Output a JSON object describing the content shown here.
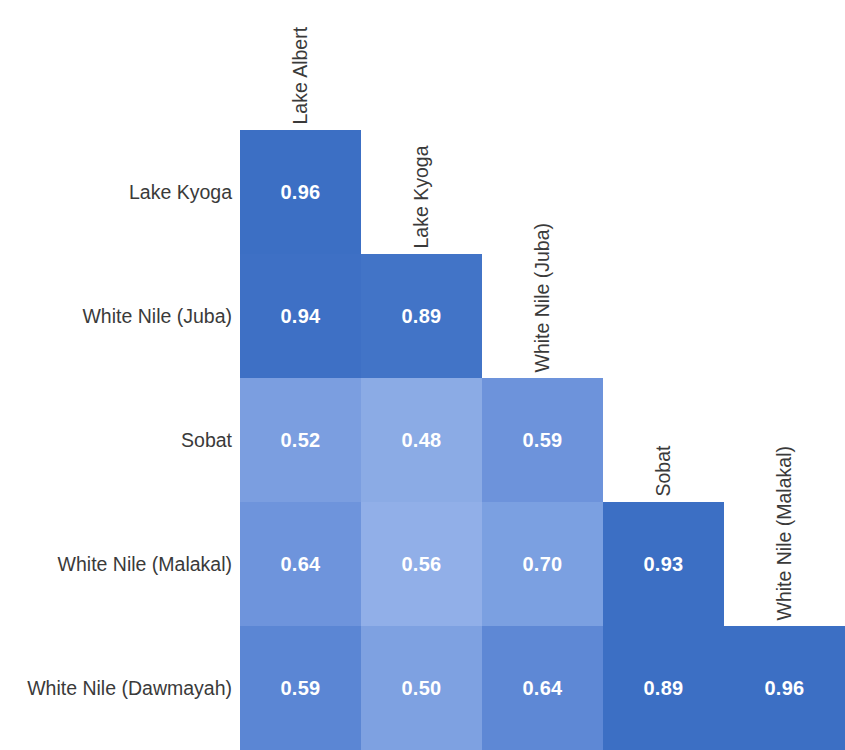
{
  "chart_data": {
    "type": "heatmap",
    "title": "",
    "subtitle": "",
    "xlabel": "",
    "ylabel": "",
    "layout": "lower-triangular correlation matrix",
    "grid": false,
    "legend": "none",
    "value_format": "2 decimals",
    "colorscale": {
      "name": "blue-sequential",
      "low_hex": "#9CB6EA",
      "mid_hex": "#7B9EE0",
      "high_hex": "#3C6FC4",
      "domain": [
        0.45,
        1.0
      ]
    },
    "text_color_hex": "#FFFFFF",
    "label_color_hex": "#3A3A3A",
    "background_hex": "#FFFFFF",
    "columns": [
      "Lake Albert",
      "Lake Kyoga",
      "White Nile (Juba)",
      "Sobat",
      "White Nile (Malakal)"
    ],
    "rows": [
      "Lake Kyoga",
      "White Nile (Juba)",
      "Sobat",
      "White Nile (Malakal)",
      "White Nile (Dawmayah)"
    ],
    "cells": [
      {
        "row": "Lake Kyoga",
        "col": "Lake Albert",
        "value": "0.96",
        "v": 0.96,
        "color": "#3C6FC4",
        "r": 0,
        "c": 0
      },
      {
        "row": "White Nile (Juba)",
        "col": "Lake Albert",
        "value": "0.94",
        "v": 0.94,
        "color": "#3E70C5",
        "r": 1,
        "c": 0
      },
      {
        "row": "White Nile (Juba)",
        "col": "Lake Kyoga",
        "value": "0.89",
        "v": 0.89,
        "color": "#4274C7",
        "r": 1,
        "c": 1
      },
      {
        "row": "Sobat",
        "col": "Lake Albert",
        "value": "0.52",
        "v": 0.52,
        "color": "#7B9EE0",
        "r": 2,
        "c": 0
      },
      {
        "row": "Sobat",
        "col": "Lake Kyoga",
        "value": "0.48",
        "v": 0.48,
        "color": "#8BABE5",
        "r": 2,
        "c": 1
      },
      {
        "row": "Sobat",
        "col": "White Nile (Juba)",
        "value": "0.59",
        "v": 0.59,
        "color": "#6D93DB",
        "r": 2,
        "c": 2
      },
      {
        "row": "White Nile (Malakal)",
        "col": "Lake Albert",
        "value": "0.64",
        "v": 0.64,
        "color": "#6E94DC",
        "r": 3,
        "c": 0
      },
      {
        "row": "White Nile (Malakal)",
        "col": "Lake Kyoga",
        "value": "0.56",
        "v": 0.56,
        "color": "#91AFE8",
        "r": 3,
        "c": 1
      },
      {
        "row": "White Nile (Malakal)",
        "col": "White Nile (Juba)",
        "value": "0.70",
        "v": 0.7,
        "color": "#7BA0E1",
        "r": 3,
        "c": 2
      },
      {
        "row": "White Nile (Malakal)",
        "col": "Sobat",
        "value": "0.93",
        "v": 0.93,
        "color": "#3C6FC4",
        "r": 3,
        "c": 3
      },
      {
        "row": "White Nile (Dawmayah)",
        "col": "Lake Albert",
        "value": "0.59",
        "v": 0.59,
        "color": "#5B86D4",
        "r": 4,
        "c": 0
      },
      {
        "row": "White Nile (Dawmayah)",
        "col": "Lake Kyoga",
        "value": "0.50",
        "v": 0.5,
        "color": "#7EA1E1",
        "r": 4,
        "c": 1
      },
      {
        "row": "White Nile (Dawmayah)",
        "col": "White Nile (Juba)",
        "value": "0.64",
        "v": 0.64,
        "color": "#5E88D5",
        "r": 4,
        "c": 2
      },
      {
        "row": "White Nile (Dawmayah)",
        "col": "Sobat",
        "value": "0.89",
        "v": 0.89,
        "color": "#3C6FC4",
        "r": 4,
        "c": 3
      },
      {
        "row": "White Nile (Dawmayah)",
        "col": "White Nile (Malakal)",
        "value": "0.96",
        "v": 0.96,
        "color": "#3C6FC4",
        "r": 4,
        "c": 4
      }
    ]
  },
  "geometry": {
    "origin_x": 240,
    "origin_y": 130,
    "cell_w": 121,
    "cell_h": 124,
    "label_col_width": 240
  }
}
